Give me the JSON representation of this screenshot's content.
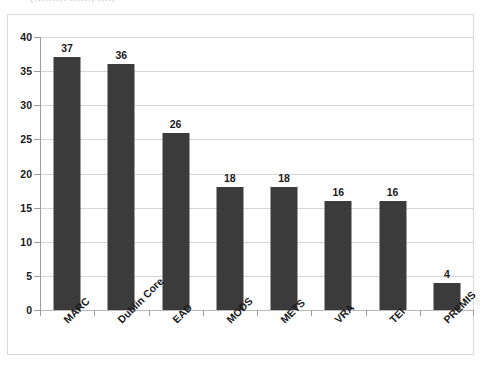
{
  "top_fragment": {
    "text": "(……… ……, ….)"
  },
  "chart_data": {
    "type": "bar",
    "title": "",
    "subtitle": "",
    "xlabel": "",
    "ylabel": "",
    "categories": [
      "MARC",
      "Dublin Core",
      "EAD",
      "MODS",
      "METS",
      "VRA",
      "TEI",
      "PREMIS"
    ],
    "values": [
      37,
      36,
      26,
      18,
      18,
      16,
      16,
      4
    ],
    "data_labels": [
      "37",
      "36",
      "26",
      "18",
      "18",
      "16",
      "16",
      "4"
    ],
    "ylim": [
      0,
      40
    ],
    "ytick_values": [
      0,
      5,
      10,
      15,
      20,
      25,
      30,
      35,
      40
    ],
    "ytick_labels": [
      "0",
      "5",
      "10",
      "15",
      "20",
      "25",
      "30",
      "35",
      "40"
    ],
    "grid": true,
    "legend": false,
    "legend_position": "none",
    "series": [
      {
        "name": "Count",
        "values": [
          37,
          36,
          26,
          18,
          18,
          16,
          16,
          4
        ]
      }
    ],
    "colors": {
      "bar": "#3b3b3b",
      "gridline": "#d6d6d6",
      "axis": "#9e9e9e",
      "frame": "#d9d9d9",
      "text": "#1a1a1a",
      "background": "#ffffff"
    }
  }
}
